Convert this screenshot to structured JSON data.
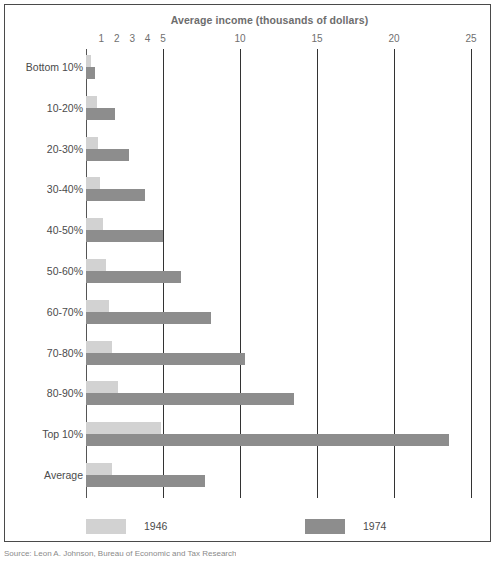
{
  "figure": {
    "title": "Average income (thousands of dollars)",
    "source": "Source: Leon A. Johnson, Bureau of Economic and Tax Research"
  },
  "legend": [
    {
      "label": "1946",
      "color": "#d2d2d2",
      "series_key": "v1946"
    },
    {
      "label": "1974",
      "color": "#8d8d8d",
      "series_key": "v1974"
    }
  ],
  "axis": {
    "label": "Average income (thousands of dollars)",
    "min": 0,
    "max": 25,
    "tick_labels": [
      "1",
      "2",
      "3",
      "4",
      "5",
      "10",
      "15",
      "20",
      "25"
    ],
    "tick_values": [
      1,
      2,
      3,
      4,
      5,
      10,
      15,
      20,
      25
    ],
    "gridline_values": [
      0,
      5,
      10,
      15,
      20,
      25
    ],
    "unit": "thousands of dollars"
  },
  "chart_data": {
    "type": "bar",
    "orientation": "horizontal",
    "title": "Average income (thousands of dollars)",
    "xlabel": "Average income (thousands of dollars)",
    "ylabel": "",
    "xlim": [
      0,
      25
    ],
    "grid": true,
    "legend_position": "bottom",
    "categories": [
      "Bottom 10%",
      "10-20%",
      "20-30%",
      "30-40%",
      "40-50%",
      "50-60%",
      "60-70%",
      "70-80%",
      "80-90%",
      "Top 10%",
      "Average"
    ],
    "series": [
      {
        "name": "1946",
        "color": "#d2d2d2",
        "values": [
          0.3,
          0.7,
          0.8,
          0.9,
          1.1,
          1.3,
          1.5,
          1.7,
          2.1,
          4.9,
          1.7
        ]
      },
      {
        "name": "1974",
        "color": "#8d8d8d",
        "values": [
          0.6,
          1.9,
          2.8,
          3.8,
          5.0,
          6.2,
          8.1,
          10.3,
          13.5,
          23.6,
          7.7
        ]
      }
    ]
  }
}
